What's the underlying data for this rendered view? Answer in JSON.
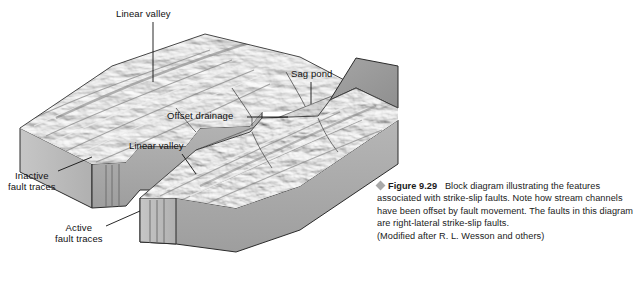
{
  "figure": {
    "bullet_icon": "diamond-bullet-icon",
    "number": "Figure 9.29",
    "body": "Block diagram illustrating the features associated with strike-slip faults. Note how stream channels have been offset by fault movement. The faults in this diagram are right-lateral strike-slip faults.",
    "attribution": "(Modified after R. L. Wesson and others)"
  },
  "diagram": {
    "type": "geologic-block-diagram",
    "labels": {
      "linear_valley_top": "Linear valley",
      "linear_valley_mid": "Linear valley",
      "sag_pond": "Sag pond",
      "offset_drainage": "Offset drainage",
      "inactive_fault_traces_line1": "Inactive",
      "inactive_fault_traces_line2": "fault traces",
      "active_fault_traces_line1": "Active",
      "active_fault_traces_line2": "fault traces"
    },
    "colors": {
      "block_front_face": "#a8a8a8",
      "block_side_face": "#bdbdbd",
      "block_cut_face": "#9a9a9a",
      "terrain_light": "#e8e8e8",
      "terrain_mid": "#b4b4b4",
      "terrain_dark": "#6f6f6f",
      "outline": "#2b2b2b",
      "leader_line": "#111111",
      "caption_text": "#1a1a1a",
      "bullet": "#a9a9a9",
      "background": "#ffffff"
    }
  }
}
